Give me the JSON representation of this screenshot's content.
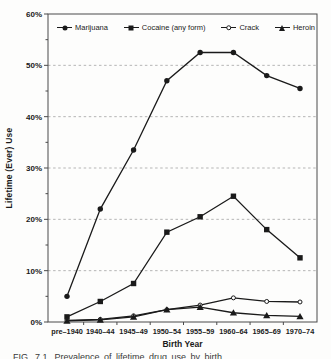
{
  "figure": {
    "caption": "FIG. 7.1. Prevalence of lifetime drug use by birth"
  },
  "chart_data": {
    "type": "line",
    "title": "",
    "xlabel": "Birth Year",
    "ylabel": "Lifetime (Ever) Use",
    "categories": [
      "pre–1940",
      "1940–44",
      "1945–49",
      "1950–54",
      "1955–59",
      "1960–64",
      "1965–69",
      "1970–74"
    ],
    "ylim": [
      0,
      60
    ],
    "y_tick_step": 10,
    "y_minor_tick_step": 5,
    "y_tick_labels": [
      "0%",
      "10%",
      "20%",
      "30%",
      "40%",
      "50%",
      "60%"
    ],
    "grid": "horizontal dashed lines at 10-50%",
    "legend_position": "top inside, single row",
    "line_color": "#1a1a1a",
    "series": [
      {
        "name": "Marijuana",
        "marker": "circle",
        "color": "#1a1a1a",
        "values": [
          5,
          22,
          33.5,
          47,
          52.5,
          52.5,
          48,
          45.5
        ]
      },
      {
        "name": "Cocaine (any form)",
        "marker": "square",
        "color": "#1a1a1a",
        "values": [
          1,
          4,
          7.5,
          17.5,
          20.5,
          24.5,
          18,
          12.5
        ]
      },
      {
        "name": "Crack",
        "marker": "circle-open",
        "color": "#1a1a1a",
        "values": [
          0.3,
          0.5,
          1.2,
          2.4,
          3.3,
          4.7,
          4.0,
          3.9
        ]
      },
      {
        "name": "Heroin",
        "marker": "triangle",
        "color": "#1a1a1a",
        "values": [
          0.2,
          0.4,
          1.0,
          2.4,
          2.9,
          1.8,
          1.3,
          1.1
        ]
      }
    ]
  }
}
